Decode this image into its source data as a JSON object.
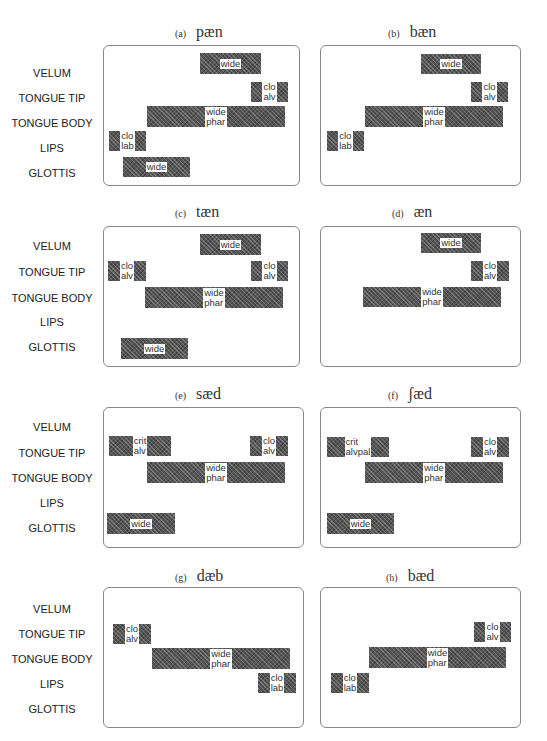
{
  "rows": [
    "VELUM",
    "TONGUE TIP",
    "TONGUE BODY",
    "LIPS",
    "GLOTTIS"
  ],
  "panels": [
    {
      "tag": "(a)",
      "word": "pæn",
      "box": [
        103,
        45,
        197,
        141
      ],
      "title": [
        175,
        23
      ],
      "bars": [
        {
          "row": 0,
          "x": 200,
          "w": 61,
          "y": 53,
          "h": 21,
          "label": "wide"
        },
        {
          "row": 1,
          "x": 251,
          "w": 37,
          "y": 82,
          "h": 20,
          "label": "clo\nalv"
        },
        {
          "row": 2,
          "x": 147,
          "w": 138,
          "y": 106,
          "h": 21,
          "label": "wide\nphar"
        },
        {
          "row": 3,
          "x": 109,
          "w": 37,
          "y": 131,
          "h": 20,
          "label": "clo\nlab"
        },
        {
          "row": 4,
          "x": 123,
          "w": 67,
          "y": 157,
          "h": 20,
          "label": "wide"
        }
      ]
    },
    {
      "tag": "(b)",
      "word": "bæn",
      "box": [
        320,
        45,
        201,
        141
      ],
      "title": [
        388,
        23
      ],
      "bars": [
        {
          "row": 0,
          "x": 421,
          "w": 60,
          "y": 54,
          "h": 20,
          "label": "wide"
        },
        {
          "row": 1,
          "x": 471,
          "w": 37,
          "y": 82,
          "h": 20,
          "label": "clo\nalv"
        },
        {
          "row": 2,
          "x": 365,
          "w": 138,
          "y": 106,
          "h": 21,
          "label": "wide\nphar"
        },
        {
          "row": 3,
          "x": 327,
          "w": 37,
          "y": 131,
          "h": 20,
          "label": "clo\nlab"
        }
      ]
    },
    {
      "tag": "(c)",
      "word": "tæn",
      "box": [
        103,
        226,
        197,
        141
      ],
      "title": [
        175,
        203
      ],
      "bars": [
        {
          "row": 0,
          "x": 200,
          "w": 61,
          "y": 234,
          "h": 21,
          "label": "wide"
        },
        {
          "row": 1,
          "x": 108,
          "w": 38,
          "y": 261,
          "h": 20,
          "label": "clo\nalv"
        },
        {
          "row": 1,
          "x": 251,
          "w": 37,
          "y": 261,
          "h": 20,
          "label": "clo\nalv"
        },
        {
          "row": 2,
          "x": 145,
          "w": 138,
          "y": 287,
          "h": 21,
          "label": "wide\nphar"
        },
        {
          "row": 4,
          "x": 121,
          "w": 67,
          "y": 338,
          "h": 21,
          "label": "wide"
        }
      ]
    },
    {
      "tag": "(d)",
      "word": "æn",
      "box": [
        320,
        226,
        201,
        141
      ],
      "title": [
        392,
        203
      ],
      "bars": [
        {
          "row": 0,
          "x": 421,
          "w": 60,
          "y": 233,
          "h": 20,
          "label": "wide"
        },
        {
          "row": 1,
          "x": 471,
          "w": 38,
          "y": 261,
          "h": 20,
          "label": "clo\nalv"
        },
        {
          "row": 2,
          "x": 363,
          "w": 138,
          "y": 287,
          "h": 20,
          "label": "wide\nphar"
        }
      ]
    },
    {
      "tag": "(e)",
      "word": "sæd",
      "box": [
        103,
        407,
        201,
        141
      ],
      "title": [
        175,
        385
      ],
      "bars": [
        {
          "row": 1,
          "x": 109,
          "w": 62,
          "y": 436,
          "h": 20,
          "label": "crit\nalv"
        },
        {
          "row": 1,
          "x": 250,
          "w": 38,
          "y": 436,
          "h": 20,
          "label": "clo\nalv"
        },
        {
          "row": 2,
          "x": 147,
          "w": 138,
          "y": 462,
          "h": 21,
          "label": "wide\nphar"
        },
        {
          "row": 4,
          "x": 107,
          "w": 68,
          "y": 513,
          "h": 21,
          "label": "wide"
        }
      ]
    },
    {
      "tag": "(f)",
      "word": "ʃæd",
      "box": [
        320,
        407,
        201,
        141
      ],
      "title": [
        388,
        385
      ],
      "bars": [
        {
          "row": 1,
          "x": 327,
          "w": 62,
          "y": 437,
          "h": 20,
          "label": "crit\nalvpal"
        },
        {
          "row": 1,
          "x": 471,
          "w": 38,
          "y": 437,
          "h": 20,
          "label": "clo\nalv"
        },
        {
          "row": 2,
          "x": 365,
          "w": 138,
          "y": 462,
          "h": 21,
          "label": "wide\nphar"
        },
        {
          "row": 4,
          "x": 327,
          "w": 67,
          "y": 513,
          "h": 21,
          "label": "wide"
        }
      ]
    },
    {
      "tag": "(g)",
      "word": "dæb",
      "box": [
        103,
        587,
        201,
        141
      ],
      "title": [
        175,
        567
      ],
      "bars": [
        {
          "row": 1,
          "x": 113,
          "w": 38,
          "y": 624,
          "h": 20,
          "label": "clo\nalv"
        },
        {
          "row": 2,
          "x": 152,
          "w": 138,
          "y": 648,
          "h": 21,
          "label": "wide\nphar"
        },
        {
          "row": 3,
          "x": 258,
          "w": 38,
          "y": 673,
          "h": 20,
          "label": "clo\nlab"
        }
      ]
    },
    {
      "tag": "(h)",
      "word": "bæd",
      "box": [
        320,
        587,
        201,
        141
      ],
      "title": [
        386,
        567
      ],
      "bars": [
        {
          "row": 1,
          "x": 474,
          "w": 37,
          "y": 622,
          "h": 20,
          "label": "clo\nalv"
        },
        {
          "row": 2,
          "x": 369,
          "w": 137,
          "y": 647,
          "h": 21,
          "label": "wide\nphar"
        },
        {
          "row": 3,
          "x": 331,
          "w": 38,
          "y": 673,
          "h": 20,
          "label": "clo\nlab"
        }
      ]
    }
  ],
  "row_label_y": {
    "a": [
      75,
      100,
      125,
      150,
      175
    ],
    "c": [
      248,
      274,
      300,
      324,
      349
    ],
    "e": [
      429,
      455,
      480,
      505,
      530
    ],
    "g": [
      611,
      636,
      661,
      686,
      711
    ]
  }
}
